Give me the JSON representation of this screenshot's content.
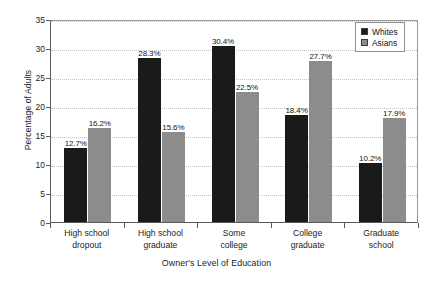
{
  "chart_data": {
    "type": "bar",
    "title": "",
    "xlabel": "Owner's Level of Education",
    "ylabel": "Percentage of Adults",
    "ylim": [
      0,
      35
    ],
    "ytick_step": 5,
    "ytick_labels": [
      "0",
      "5",
      "10",
      "15",
      "20",
      "25",
      "30",
      "35"
    ],
    "ytick_values": [
      0,
      5,
      10,
      15,
      20,
      25,
      30,
      35
    ],
    "grid": "horizontal-dotted",
    "legend_position": "top-right",
    "categories": [
      "High school\ndropout",
      "High school\ngraduate",
      "Some\ncollege",
      "College\ngraduate",
      "Graduate\nschool"
    ],
    "category_lines": [
      [
        "High school",
        "dropout"
      ],
      [
        "High school",
        "graduate"
      ],
      [
        "Some",
        "college"
      ],
      [
        "College",
        "graduate"
      ],
      [
        "Graduate",
        "school"
      ]
    ],
    "series": [
      {
        "name": "Whites",
        "color": "#1a1a1a",
        "values": [
          12.7,
          28.3,
          30.4,
          18.4,
          10.2
        ],
        "labels": [
          "12.7%",
          "28.3%",
          "30.4%",
          "18.4%",
          "10.2%"
        ]
      },
      {
        "name": "Asians",
        "color": "#8c8c8c",
        "values": [
          16.2,
          15.6,
          22.5,
          27.7,
          17.9
        ],
        "labels": [
          "16.2%",
          "15.6%",
          "22.5%",
          "27.7%",
          "17.9%"
        ]
      }
    ]
  },
  "legend": {
    "items": [
      {
        "label": "Whites",
        "swatch": "whites"
      },
      {
        "label": "Asians",
        "swatch": "asians"
      }
    ]
  }
}
